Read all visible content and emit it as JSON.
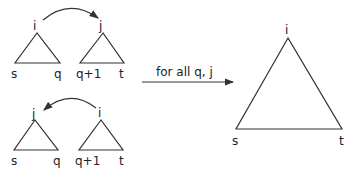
{
  "diagram": {
    "top_left_tree": {
      "root": "i",
      "left_leaf": "s",
      "right_leaf": "q"
    },
    "top_right_tree": {
      "root": "j",
      "left_leaf": "q+1",
      "right_leaf": "t"
    },
    "bottom_left_tree": {
      "root": "j",
      "left_leaf": "s",
      "right_leaf": "q"
    },
    "bottom_right_tree": {
      "root": "i",
      "left_leaf": "q+1",
      "right_leaf": "t"
    },
    "arrow_label": "for all q, j",
    "result_tree": {
      "root": "i",
      "left_leaf": "s",
      "right_leaf": "t"
    }
  }
}
